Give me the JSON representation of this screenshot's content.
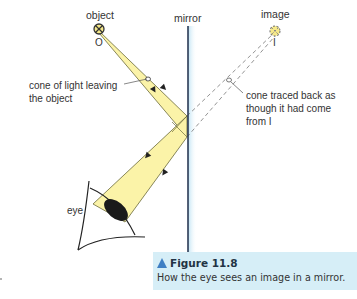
{
  "labels": {
    "object": "object",
    "object_point": "O",
    "mirror": "mirror",
    "image": "image",
    "image_point": "I",
    "eye": "eye",
    "cone_leaving_line1": "cone of light leaving",
    "cone_leaving_line2": "the object",
    "cone_traced_line1": "cone traced back as",
    "cone_traced_line2": "though it had come",
    "cone_traced_line3": "from I"
  },
  "caption": {
    "title": "Figure 11.8",
    "text": "How the eye sees an image in a mirror."
  },
  "colors": {
    "beam_fill": "#fbf3a8",
    "beam_stroke": "#6b6a3a",
    "mirror": "#2b3a55",
    "mirror_glow": "#cde9f6",
    "caption_bg": "#d6eef7",
    "caption_triangle": "#3f7fc4",
    "dashed_lines": "#777777"
  }
}
